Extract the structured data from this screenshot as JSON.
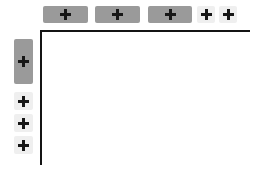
{
  "canvas": {
    "width": 258,
    "height": 169,
    "background": "#ffffff"
  },
  "axes": {
    "line_color": "#141414",
    "line_thickness": 2,
    "origin_x": 40,
    "origin_y": 30,
    "x_axis_length": 210,
    "y_axis_length": 135,
    "x_axis_label": "",
    "y_axis_label": ""
  },
  "colors": {
    "button_strong": "#9a9a9a",
    "button_faint": "#efefef",
    "glyph": "#171717",
    "axis": "#141414"
  },
  "column_buttons": {
    "group_name": "column-add-buttons",
    "orientation": "horizontal",
    "items": [
      {
        "label": "+",
        "icon": "plus-icon",
        "emphasis": "strong",
        "slot": 1
      },
      {
        "label": "+",
        "icon": "plus-icon",
        "emphasis": "strong",
        "slot": 2
      },
      {
        "label": "+",
        "icon": "plus-icon",
        "emphasis": "strong",
        "slot": 3
      },
      {
        "label": "+",
        "icon": "plus-icon",
        "emphasis": "faint",
        "slot": 4
      },
      {
        "label": "+",
        "icon": "plus-icon",
        "emphasis": "faint",
        "slot": 5
      }
    ]
  },
  "row_buttons": {
    "group_name": "row-add-buttons",
    "orientation": "vertical",
    "items": [
      {
        "label": "+",
        "icon": "plus-icon",
        "emphasis": "strong",
        "slot": 1
      },
      {
        "label": "+",
        "icon": "plus-icon",
        "emphasis": "faint",
        "slot": 2
      },
      {
        "label": "+",
        "icon": "plus-icon",
        "emphasis": "faint",
        "slot": 3
      },
      {
        "label": "+",
        "icon": "plus-icon",
        "emphasis": "faint",
        "slot": 4
      }
    ]
  },
  "plot_area": {
    "content": "",
    "empty": true
  },
  "chart_data": {
    "type": "table",
    "title": "",
    "xlabel": "",
    "ylabel": "",
    "grid": false,
    "legend": null,
    "categories": [],
    "values": [],
    "annotations": [],
    "note": "Empty plot frame with L-shaped axes; no data series plotted. Surrounding controls are add (+) buttons for columns along the top and rows along the left."
  }
}
